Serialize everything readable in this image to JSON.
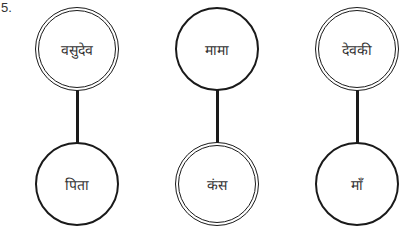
{
  "question_number": "5.",
  "pairs": [
    {
      "top": {
        "label": "वसुदेव",
        "style": "double"
      },
      "bottom": {
        "label": "पिता",
        "style": "single"
      }
    },
    {
      "top": {
        "label": "मामा",
        "style": "single"
      },
      "bottom": {
        "label": "कंस",
        "style": "double"
      }
    },
    {
      "top": {
        "label": "देवकी",
        "style": "double"
      },
      "bottom": {
        "label": "माँ",
        "style": "single"
      }
    }
  ],
  "colors": {
    "stroke": "#1a1a1a",
    "background": "#ffffff",
    "text": "#333333"
  }
}
